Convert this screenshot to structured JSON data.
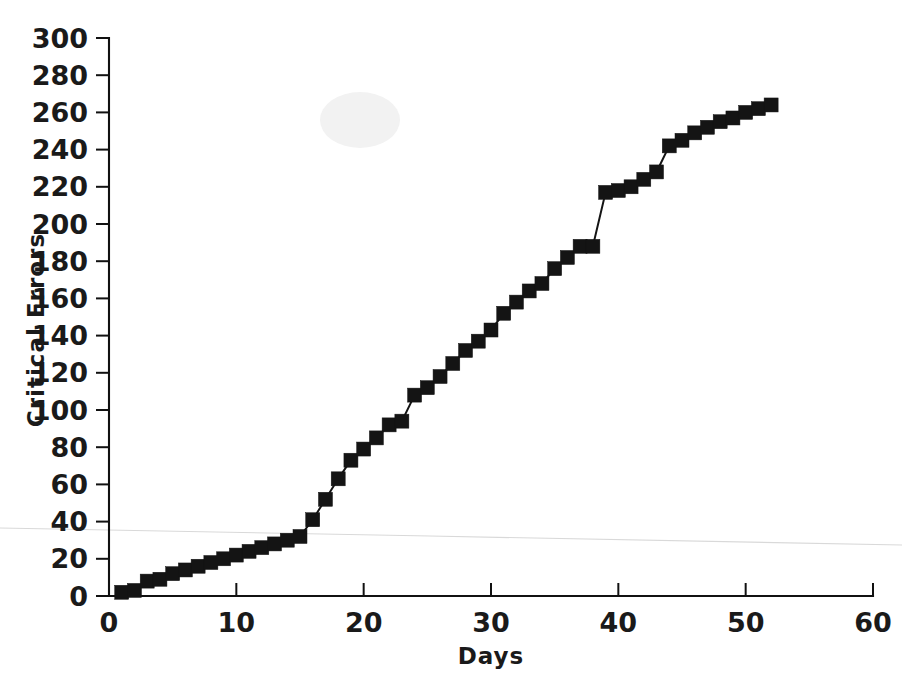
{
  "figure": {
    "background_color": "#ffffff",
    "ink_color": "#141414",
    "artifact_color": "#d9d9d9"
  },
  "chart_data": {
    "type": "line",
    "title": "",
    "subtitle": "",
    "xlabel": "Days",
    "ylabel": "Critical Errors",
    "xlim": [
      0,
      60
    ],
    "ylim": [
      0,
      300
    ],
    "xticks": [
      0,
      10,
      20,
      30,
      40,
      50,
      60
    ],
    "yticks": [
      0,
      20,
      40,
      60,
      80,
      100,
      120,
      140,
      160,
      180,
      200,
      220,
      240,
      260,
      280,
      300
    ],
    "xtick_labels": [
      "0",
      "10",
      "20",
      "30",
      "40",
      "50",
      "60"
    ],
    "ytick_labels": [
      "0",
      "20",
      "40",
      "60",
      "80",
      "100",
      "120",
      "140",
      "160",
      "180",
      "200",
      "220",
      "240",
      "260",
      "280",
      "300"
    ],
    "grid": false,
    "legend": null,
    "legend_position": "none",
    "marker": "square",
    "marker_size": 14,
    "annotations": [],
    "series": [
      {
        "name": "Cumulative critical errors",
        "x": [
          1,
          2,
          3,
          4,
          5,
          6,
          7,
          8,
          9,
          10,
          11,
          12,
          13,
          14,
          15,
          16,
          17,
          18,
          19,
          20,
          21,
          22,
          23,
          24,
          25,
          26,
          27,
          28,
          29,
          30,
          31,
          32,
          33,
          34,
          35,
          36,
          37,
          38,
          39,
          40,
          41,
          42,
          43,
          44,
          45,
          46,
          47,
          48,
          49,
          50,
          51,
          52
        ],
        "values": [
          2,
          3,
          8,
          9,
          12,
          14,
          16,
          18,
          20,
          22,
          24,
          26,
          28,
          30,
          32,
          41,
          52,
          63,
          73,
          79,
          85,
          92,
          94,
          108,
          112,
          118,
          125,
          132,
          137,
          143,
          152,
          158,
          164,
          168,
          176,
          182,
          188,
          188,
          217,
          218,
          220,
          224,
          228,
          242,
          245,
          249,
          252,
          255,
          257,
          260,
          262,
          264
        ]
      }
    ]
  },
  "axes": {
    "y_axis_name": "Critical Errors",
    "x_axis_name": "Days"
  }
}
